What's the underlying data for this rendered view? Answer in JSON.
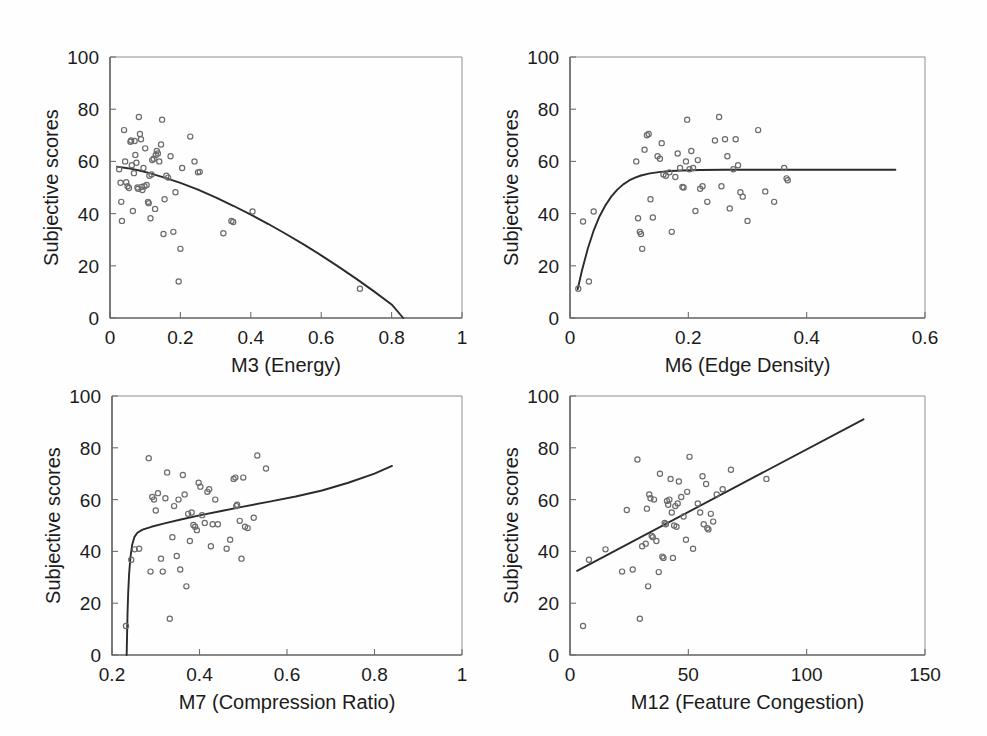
{
  "figure": {
    "background_color": "#fefefe",
    "marker_color": "#6b6b6b",
    "curve_color": "#2b2b2b",
    "axis_color": "#4a4a4a",
    "shared_ylabel": "Subjective scores",
    "panel_count": 4,
    "layout": "2x2 grid"
  },
  "chart_data": [
    {
      "id": "m3-energy",
      "type": "scatter",
      "title": "",
      "xlabel": "M3 (Energy)",
      "ylabel": "Subjective scores",
      "xlim": [
        0,
        1
      ],
      "ylim": [
        0,
        100
      ],
      "xticks": [
        0,
        0.2,
        0.4,
        0.6,
        0.8,
        1
      ],
      "xtick_labels": [
        "0",
        "0.2",
        "0.4",
        "0.6",
        "0.8",
        "1"
      ],
      "yticks": [
        0,
        20,
        40,
        60,
        80,
        100
      ],
      "ytick_labels": [
        "0",
        "20",
        "40",
        "60",
        "80",
        "100"
      ],
      "grid": false,
      "legend": "none",
      "fit_type": "quadratic-decreasing",
      "fit_points": [
        [
          0.02,
          58.0
        ],
        [
          0.05,
          57.4
        ],
        [
          0.08,
          56.6
        ],
        [
          0.11,
          55.6
        ],
        [
          0.15,
          54.0
        ],
        [
          0.2,
          51.8
        ],
        [
          0.25,
          49.2
        ],
        [
          0.3,
          46.2
        ],
        [
          0.35,
          43.0
        ],
        [
          0.4,
          39.6
        ],
        [
          0.45,
          36.0
        ],
        [
          0.5,
          32.2
        ],
        [
          0.55,
          28.2
        ],
        [
          0.6,
          24.0
        ],
        [
          0.65,
          19.6
        ],
        [
          0.7,
          15.0
        ],
        [
          0.75,
          10.2
        ],
        [
          0.8,
          5.2
        ],
        [
          0.833,
          0.0
        ]
      ],
      "points": [
        [
          0.026,
          57.0
        ],
        [
          0.03,
          51.8
        ],
        [
          0.032,
          44.5
        ],
        [
          0.034,
          37.2
        ],
        [
          0.04,
          72.0
        ],
        [
          0.043,
          60.0
        ],
        [
          0.046,
          52.0
        ],
        [
          0.05,
          50.5
        ],
        [
          0.054,
          49.8
        ],
        [
          0.058,
          67.5
        ],
        [
          0.06,
          68.0
        ],
        [
          0.062,
          58.5
        ],
        [
          0.065,
          41.0
        ],
        [
          0.068,
          55.5
        ],
        [
          0.07,
          67.8
        ],
        [
          0.072,
          62.5
        ],
        [
          0.075,
          59.5
        ],
        [
          0.078,
          50.0
        ],
        [
          0.08,
          49.5
        ],
        [
          0.082,
          77.0
        ],
        [
          0.085,
          70.5
        ],
        [
          0.088,
          68.5
        ],
        [
          0.09,
          50.2
        ],
        [
          0.092,
          49.0
        ],
        [
          0.095,
          57.5
        ],
        [
          0.098,
          50.5
        ],
        [
          0.1,
          65.0
        ],
        [
          0.104,
          51.0
        ],
        [
          0.108,
          44.5
        ],
        [
          0.11,
          44.0
        ],
        [
          0.112,
          54.5
        ],
        [
          0.115,
          38.2
        ],
        [
          0.118,
          55.0
        ],
        [
          0.12,
          60.5
        ],
        [
          0.124,
          61.0
        ],
        [
          0.128,
          41.8
        ],
        [
          0.13,
          62.5
        ],
        [
          0.133,
          64.0
        ],
        [
          0.136,
          63.0
        ],
        [
          0.14,
          60.0
        ],
        [
          0.145,
          66.5
        ],
        [
          0.148,
          76.0
        ],
        [
          0.152,
          32.2
        ],
        [
          0.155,
          45.5
        ],
        [
          0.16,
          54.5
        ],
        [
          0.165,
          53.8
        ],
        [
          0.172,
          62.0
        ],
        [
          0.18,
          33.0
        ],
        [
          0.186,
          48.2
        ],
        [
          0.195,
          14.0
        ],
        [
          0.2,
          26.5
        ],
        [
          0.205,
          57.5
        ],
        [
          0.228,
          69.5
        ],
        [
          0.24,
          60.0
        ],
        [
          0.25,
          55.8
        ],
        [
          0.255,
          56.0
        ],
        [
          0.322,
          32.5
        ],
        [
          0.345,
          37.2
        ],
        [
          0.35,
          36.8
        ],
        [
          0.405,
          40.8
        ],
        [
          0.71,
          11.2
        ]
      ]
    },
    {
      "id": "m6-edge-density",
      "type": "scatter",
      "title": "",
      "xlabel": "M6 (Edge Density)",
      "ylabel": "Subjective scores",
      "xlim": [
        0,
        0.6
      ],
      "ylim": [
        0,
        100
      ],
      "xticks": [
        0,
        0.2,
        0.4,
        0.6
      ],
      "xtick_labels": [
        "0",
        "0.2",
        "0.4",
        "0.6"
      ],
      "yticks": [
        0,
        20,
        40,
        60,
        80,
        100
      ],
      "ytick_labels": [
        "0",
        "20",
        "40",
        "60",
        "80",
        "100"
      ],
      "grid": false,
      "legend": "none",
      "fit_type": "saturating-exponential",
      "fit_points": [
        [
          0.013,
          11.0
        ],
        [
          0.02,
          18.0
        ],
        [
          0.03,
          26.5
        ],
        [
          0.04,
          33.5
        ],
        [
          0.05,
          39.0
        ],
        [
          0.06,
          43.2
        ],
        [
          0.07,
          46.6
        ],
        [
          0.08,
          49.2
        ],
        [
          0.09,
          51.2
        ],
        [
          0.1,
          52.7
        ],
        [
          0.11,
          53.8
        ],
        [
          0.12,
          54.6
        ],
        [
          0.135,
          55.4
        ],
        [
          0.15,
          55.9
        ],
        [
          0.17,
          56.3
        ],
        [
          0.19,
          56.5
        ],
        [
          0.22,
          56.7
        ],
        [
          0.26,
          56.8
        ],
        [
          0.32,
          56.8
        ],
        [
          0.4,
          56.8
        ],
        [
          0.48,
          56.8
        ],
        [
          0.55,
          56.8
        ]
      ],
      "points": [
        [
          0.014,
          11.2
        ],
        [
          0.022,
          37.0
        ],
        [
          0.032,
          14.0
        ],
        [
          0.04,
          40.8
        ],
        [
          0.112,
          60.0
        ],
        [
          0.115,
          38.2
        ],
        [
          0.118,
          33.0
        ],
        [
          0.12,
          32.2
        ],
        [
          0.122,
          26.5
        ],
        [
          0.126,
          64.5
        ],
        [
          0.13,
          70.0
        ],
        [
          0.133,
          70.5
        ],
        [
          0.136,
          45.5
        ],
        [
          0.14,
          38.5
        ],
        [
          0.148,
          62.0
        ],
        [
          0.152,
          61.0
        ],
        [
          0.155,
          67.0
        ],
        [
          0.158,
          55.0
        ],
        [
          0.162,
          54.5
        ],
        [
          0.168,
          55.8
        ],
        [
          0.172,
          33.0
        ],
        [
          0.178,
          54.0
        ],
        [
          0.182,
          63.0
        ],
        [
          0.186,
          57.5
        ],
        [
          0.19,
          50.2
        ],
        [
          0.192,
          50.0
        ],
        [
          0.196,
          60.0
        ],
        [
          0.198,
          76.0
        ],
        [
          0.202,
          57.0
        ],
        [
          0.205,
          64.0
        ],
        [
          0.208,
          57.5
        ],
        [
          0.212,
          41.0
        ],
        [
          0.216,
          60.5
        ],
        [
          0.22,
          49.5
        ],
        [
          0.224,
          50.5
        ],
        [
          0.232,
          44.5
        ],
        [
          0.245,
          68.0
        ],
        [
          0.252,
          77.0
        ],
        [
          0.256,
          50.5
        ],
        [
          0.262,
          68.5
        ],
        [
          0.266,
          62.0
        ],
        [
          0.27,
          42.0
        ],
        [
          0.276,
          57.0
        ],
        [
          0.28,
          68.5
        ],
        [
          0.284,
          58.5
        ],
        [
          0.288,
          48.2
        ],
        [
          0.292,
          46.5
        ],
        [
          0.3,
          37.2
        ],
        [
          0.318,
          72.0
        ],
        [
          0.33,
          48.5
        ],
        [
          0.345,
          44.5
        ],
        [
          0.362,
          57.5
        ],
        [
          0.366,
          53.5
        ],
        [
          0.368,
          52.8
        ]
      ]
    },
    {
      "id": "m7-compression-ratio",
      "type": "scatter",
      "title": "",
      "xlabel": "M7 (Compression Ratio)",
      "ylabel": "Subjective scores",
      "xlim": [
        0.2,
        1.0
      ],
      "ylim": [
        0,
        100
      ],
      "xticks": [
        0.2,
        0.4,
        0.6,
        0.8,
        1.0
      ],
      "xtick_labels": [
        "0.2",
        "0.4",
        "0.6",
        "0.8",
        "1"
      ],
      "yticks": [
        0,
        20,
        40,
        60,
        80,
        100
      ],
      "ytick_labels": [
        "0",
        "20",
        "40",
        "60",
        "80",
        "100"
      ],
      "grid": false,
      "legend": "none",
      "fit_type": "logarithmic",
      "fit_points": [
        [
          0.2335,
          0.0
        ],
        [
          0.2345,
          8.0
        ],
        [
          0.2355,
          16.0
        ],
        [
          0.237,
          24.0
        ],
        [
          0.239,
          31.0
        ],
        [
          0.242,
          37.5
        ],
        [
          0.246,
          42.5
        ],
        [
          0.251,
          45.5
        ],
        [
          0.258,
          47.2
        ],
        [
          0.27,
          48.4
        ],
        [
          0.29,
          49.5
        ],
        [
          0.32,
          50.8
        ],
        [
          0.36,
          52.4
        ],
        [
          0.4,
          53.9
        ],
        [
          0.45,
          55.6
        ],
        [
          0.5,
          57.3
        ],
        [
          0.56,
          59.2
        ],
        [
          0.62,
          61.2
        ],
        [
          0.68,
          63.5
        ],
        [
          0.74,
          66.5
        ],
        [
          0.8,
          70.0
        ],
        [
          0.84,
          73.0
        ]
      ],
      "points": [
        [
          0.232,
          11.2
        ],
        [
          0.244,
          36.8
        ],
        [
          0.252,
          40.8
        ],
        [
          0.262,
          41.0
        ],
        [
          0.284,
          76.0
        ],
        [
          0.288,
          32.2
        ],
        [
          0.292,
          61.0
        ],
        [
          0.296,
          60.0
        ],
        [
          0.3,
          55.8
        ],
        [
          0.305,
          62.5
        ],
        [
          0.312,
          37.2
        ],
        [
          0.316,
          32.2
        ],
        [
          0.322,
          60.5
        ],
        [
          0.326,
          70.5
        ],
        [
          0.332,
          14.0
        ],
        [
          0.338,
          45.5
        ],
        [
          0.342,
          57.5
        ],
        [
          0.348,
          38.2
        ],
        [
          0.352,
          60.0
        ],
        [
          0.356,
          33.0
        ],
        [
          0.362,
          69.5
        ],
        [
          0.366,
          62.0
        ],
        [
          0.37,
          26.5
        ],
        [
          0.374,
          54.5
        ],
        [
          0.378,
          44.0
        ],
        [
          0.382,
          55.0
        ],
        [
          0.386,
          50.2
        ],
        [
          0.39,
          49.5
        ],
        [
          0.394,
          48.2
        ],
        [
          0.398,
          66.5
        ],
        [
          0.402,
          65.0
        ],
        [
          0.406,
          54.0
        ],
        [
          0.412,
          51.0
        ],
        [
          0.418,
          63.0
        ],
        [
          0.422,
          64.0
        ],
        [
          0.426,
          42.0
        ],
        [
          0.43,
          50.5
        ],
        [
          0.436,
          60.0
        ],
        [
          0.442,
          50.5
        ],
        [
          0.462,
          41.0
        ],
        [
          0.47,
          44.5
        ],
        [
          0.478,
          68.0
        ],
        [
          0.482,
          68.5
        ],
        [
          0.484,
          57.5
        ],
        [
          0.486,
          58.0
        ],
        [
          0.492,
          51.8
        ],
        [
          0.496,
          37.2
        ],
        [
          0.5,
          68.5
        ],
        [
          0.504,
          49.5
        ],
        [
          0.51,
          49.0
        ],
        [
          0.524,
          53.0
        ],
        [
          0.532,
          77.0
        ],
        [
          0.552,
          72.0
        ]
      ]
    },
    {
      "id": "m12-feature-congestion",
      "type": "scatter",
      "title": "",
      "xlabel": "M12 (Feature Congestion)",
      "ylabel": "Subjective scores",
      "xlim": [
        0,
        150
      ],
      "ylim": [
        0,
        100
      ],
      "xticks": [
        0,
        50,
        100,
        150
      ],
      "xtick_labels": [
        "0",
        "50",
        "100",
        "150"
      ],
      "yticks": [
        0,
        20,
        40,
        60,
        80,
        100
      ],
      "ytick_labels": [
        "0",
        "20",
        "40",
        "60",
        "80",
        "100"
      ],
      "grid": false,
      "legend": "none",
      "fit_type": "linear",
      "fit_points": [
        [
          3.0,
          32.5
        ],
        [
          124.0,
          91.0
        ]
      ],
      "points": [
        [
          5.5,
          11.2
        ],
        [
          8.0,
          36.8
        ],
        [
          15.0,
          40.8
        ],
        [
          22.0,
          32.2
        ],
        [
          24.0,
          56.0
        ],
        [
          26.5,
          33.0
        ],
        [
          28.5,
          75.5
        ],
        [
          29.5,
          14.0
        ],
        [
          30.5,
          42.0
        ],
        [
          32.0,
          43.0
        ],
        [
          32.5,
          56.5
        ],
        [
          33.0,
          26.5
        ],
        [
          33.5,
          62.0
        ],
        [
          34.0,
          60.5
        ],
        [
          34.5,
          46.0
        ],
        [
          35.0,
          45.5
        ],
        [
          35.5,
          60.0
        ],
        [
          36.5,
          44.0
        ],
        [
          37.5,
          32.0
        ],
        [
          38.0,
          70.0
        ],
        [
          39.0,
          38.0
        ],
        [
          39.5,
          37.5
        ],
        [
          40.0,
          51.0
        ],
        [
          40.5,
          50.5
        ],
        [
          41.0,
          59.5
        ],
        [
          41.5,
          58.0
        ],
        [
          42.0,
          60.0
        ],
        [
          42.5,
          68.0
        ],
        [
          43.0,
          55.0
        ],
        [
          43.5,
          37.5
        ],
        [
          44.0,
          50.0
        ],
        [
          44.5,
          57.5
        ],
        [
          45.0,
          49.5
        ],
        [
          45.5,
          58.5
        ],
        [
          46.0,
          67.0
        ],
        [
          47.0,
          61.0
        ],
        [
          48.0,
          53.5
        ],
        [
          49.0,
          44.5
        ],
        [
          49.5,
          63.0
        ],
        [
          50.5,
          76.5
        ],
        [
          52.0,
          41.0
        ],
        [
          54.0,
          58.5
        ],
        [
          55.0,
          55.0
        ],
        [
          56.0,
          69.0
        ],
        [
          56.5,
          50.5
        ],
        [
          57.5,
          66.0
        ],
        [
          58.0,
          49.0
        ],
        [
          58.5,
          48.5
        ],
        [
          59.5,
          54.5
        ],
        [
          60.5,
          51.5
        ],
        [
          62.0,
          62.0
        ],
        [
          64.5,
          64.0
        ],
        [
          68.0,
          71.5
        ],
        [
          83.0,
          68.0
        ]
      ]
    }
  ]
}
